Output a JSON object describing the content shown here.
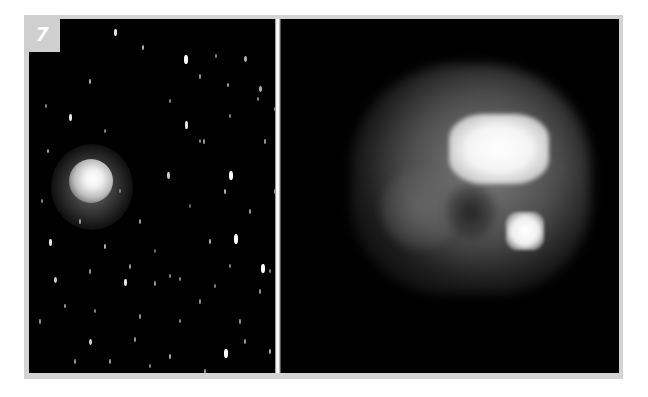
{
  "figure": {
    "label": "7",
    "panels": [
      {
        "id": "left",
        "description": "Wide-field image of comet with fuzzy coma among trailed star field"
      },
      {
        "id": "right",
        "description": "Pixelated close-up of comet nucleus region showing bright lobe and secondary bright spot"
      }
    ]
  },
  "colors": {
    "frame": "#d3d3d3",
    "label_bg": "#cfcfcf",
    "label_text": "#ffffff",
    "sky": "#000000"
  },
  "stars": [
    [
      85,
      10,
      3,
      7,
      0.9
    ],
    [
      155,
      36,
      4,
      9,
      1
    ],
    [
      113,
      26,
      2,
      5,
      0.7
    ],
    [
      170,
      55,
      2,
      5,
      0.6
    ],
    [
      215,
      37,
      3,
      6,
      0.7
    ],
    [
      186,
      35,
      2,
      4,
      0.5
    ],
    [
      247,
      47,
      2,
      5,
      0.7
    ],
    [
      198,
      64,
      2,
      4,
      0.6
    ],
    [
      230,
      67,
      3,
      6,
      0.7
    ],
    [
      156,
      102,
      3,
      8,
      0.9
    ],
    [
      174,
      120,
      2,
      5,
      0.6
    ],
    [
      200,
      95,
      2,
      4,
      0.5
    ],
    [
      228,
      78,
      2,
      4,
      0.5
    ],
    [
      40,
      95,
      3,
      7,
      0.9
    ],
    [
      60,
      60,
      2,
      5,
      0.7
    ],
    [
      75,
      110,
      2,
      4,
      0.5
    ],
    [
      140,
      80,
      2,
      4,
      0.5
    ],
    [
      138,
      153,
      3,
      7,
      0.8
    ],
    [
      200,
      152,
      4,
      9,
      1
    ],
    [
      195,
      170,
      2,
      5,
      0.7
    ],
    [
      170,
      120,
      2,
      4,
      0.5
    ],
    [
      235,
      120,
      2,
      5,
      0.6
    ],
    [
      245,
      88,
      2,
      4,
      0.6
    ],
    [
      18,
      130,
      2,
      4,
      0.6
    ],
    [
      20,
      220,
      3,
      7,
      0.9
    ],
    [
      16,
      85,
      2,
      4,
      0.5
    ],
    [
      110,
      200,
      2,
      5,
      0.6
    ],
    [
      75,
      225,
      2,
      5,
      0.7
    ],
    [
      60,
      250,
      2,
      5,
      0.6
    ],
    [
      25,
      258,
      3,
      6,
      0.8
    ],
    [
      35,
      285,
      2,
      4,
      0.6
    ],
    [
      95,
      260,
      3,
      7,
      0.9
    ],
    [
      110,
      295,
      2,
      5,
      0.6
    ],
    [
      125,
      262,
      2,
      5,
      0.6
    ],
    [
      150,
      258,
      2,
      4,
      0.5
    ],
    [
      170,
      280,
      2,
      5,
      0.6
    ],
    [
      200,
      245,
      2,
      4,
      0.5
    ],
    [
      210,
      300,
      2,
      5,
      0.6
    ],
    [
      230,
      270,
      2,
      5,
      0.6
    ],
    [
      240,
      250,
      2,
      4,
      0.5
    ],
    [
      232,
      245,
      4,
      9,
      1
    ],
    [
      205,
      215,
      4,
      10,
      1
    ],
    [
      220,
      190,
      2,
      5,
      0.6
    ],
    [
      180,
      220,
      2,
      5,
      0.7
    ],
    [
      60,
      320,
      3,
      6,
      0.8
    ],
    [
      80,
      340,
      2,
      5,
      0.6
    ],
    [
      105,
      318,
      2,
      5,
      0.6
    ],
    [
      140,
      335,
      2,
      5,
      0.7
    ],
    [
      150,
      300,
      2,
      4,
      0.5
    ],
    [
      175,
      350,
      2,
      5,
      0.6
    ],
    [
      195,
      330,
      4,
      9,
      1
    ],
    [
      215,
      320,
      2,
      5,
      0.6
    ],
    [
      240,
      330,
      2,
      5,
      0.7
    ],
    [
      250,
      300,
      2,
      4,
      0.5
    ],
    [
      45,
      340,
      2,
      5,
      0.6
    ],
    [
      10,
      300,
      2,
      5,
      0.6
    ],
    [
      12,
      180,
      2,
      4,
      0.5
    ],
    [
      90,
      170,
      2,
      4,
      0.4
    ],
    [
      125,
      230,
      2,
      4,
      0.4
    ],
    [
      160,
      185,
      2,
      4,
      0.4
    ],
    [
      50,
      200,
      2,
      5,
      0.6
    ],
    [
      65,
      290,
      2,
      4,
      0.5
    ],
    [
      120,
      345,
      2,
      4,
      0.5
    ],
    [
      222,
      355,
      2,
      4,
      0.5
    ],
    [
      100,
      245,
      2,
      5,
      0.6
    ],
    [
      140,
      255,
      2,
      4,
      0.5
    ],
    [
      245,
      170,
      2,
      5,
      0.6
    ],
    [
      185,
      265,
      2,
      4,
      0.5
    ]
  ]
}
